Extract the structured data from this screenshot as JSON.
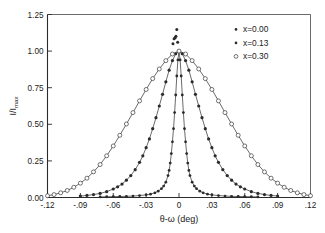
{
  "figure": {
    "background_color": "#ffffff",
    "ink_color": "#2b2b2b"
  },
  "chart_data": {
    "type": "line",
    "title": "",
    "subtitle": "",
    "xlabel": "θ-ω  (deg)",
    "ylabel": "I/I max",
    "ylabel_main": "I/I",
    "ylabel_sub": "max",
    "xlim": [
      -0.12,
      0.12
    ],
    "ylim": [
      0.0,
      1.25
    ],
    "grid": false,
    "legend_position": "top-right",
    "xticks": [
      -0.12,
      -0.09,
      -0.06,
      -0.03,
      0,
      0.03,
      0.06,
      0.09,
      0.12
    ],
    "xtick_labels": [
      "-.12",
      "-.09",
      "-.06",
      "-.03",
      "0",
      ".03",
      ".06",
      ".09",
      ".12"
    ],
    "yticks": [
      0.0,
      0.25,
      0.5,
      0.75,
      1.0,
      1.25
    ],
    "ytick_labels": [
      "0.00",
      "0.25",
      "0.50",
      "0.75",
      "1.00",
      "1.25"
    ],
    "series": [
      {
        "name": "x=0.00",
        "marker": "filled-dot",
        "marker_size": 1.4,
        "fwhm_deg": 0.0105,
        "peak": 1.0,
        "x": [
          -0.072,
          -0.066,
          -0.06,
          -0.054,
          -0.048,
          -0.042,
          -0.036,
          -0.03,
          -0.026,
          -0.022,
          -0.019,
          -0.016,
          -0.014,
          -0.012,
          -0.01,
          -0.009,
          -0.008,
          -0.007,
          -0.006,
          -0.005,
          -0.004,
          -0.003,
          -0.002,
          -0.001,
          0.0,
          0.001,
          0.002,
          0.003,
          0.004,
          0.005,
          0.006,
          0.007,
          0.008,
          0.009,
          0.01,
          0.012,
          0.014,
          0.016,
          0.019,
          0.022,
          0.026,
          0.03,
          0.036,
          0.042,
          0.048,
          0.054,
          0.06,
          0.066,
          0.072
        ],
        "y": [
          0.004,
          0.005,
          0.006,
          0.007,
          0.008,
          0.01,
          0.013,
          0.018,
          0.023,
          0.032,
          0.043,
          0.06,
          0.078,
          0.105,
          0.15,
          0.185,
          0.235,
          0.3,
          0.38,
          0.47,
          0.58,
          0.7,
          0.83,
          0.94,
          1.0,
          0.94,
          0.83,
          0.7,
          0.58,
          0.47,
          0.38,
          0.3,
          0.235,
          0.185,
          0.15,
          0.105,
          0.078,
          0.06,
          0.043,
          0.032,
          0.023,
          0.018,
          0.013,
          0.01,
          0.008,
          0.007,
          0.006,
          0.005,
          0.004
        ]
      },
      {
        "name": "x=0.13",
        "marker": "filled-dot",
        "marker_size": 1.6,
        "fwhm_deg": 0.044,
        "peak": 1.0,
        "x": [
          -0.09,
          -0.084,
          -0.078,
          -0.072,
          -0.066,
          -0.06,
          -0.056,
          -0.052,
          -0.048,
          -0.044,
          -0.04,
          -0.036,
          -0.033,
          -0.03,
          -0.027,
          -0.024,
          -0.021,
          -0.018,
          -0.015,
          -0.012,
          -0.009,
          -0.006,
          -0.003,
          0.0,
          0.003,
          0.006,
          0.009,
          0.012,
          0.015,
          0.018,
          0.021,
          0.024,
          0.027,
          0.03,
          0.033,
          0.036,
          0.04,
          0.044,
          0.048,
          0.052,
          0.056,
          0.06,
          0.066,
          0.072,
          0.078,
          0.084,
          0.09
        ],
        "y": [
          0.01,
          0.014,
          0.02,
          0.028,
          0.04,
          0.058,
          0.073,
          0.092,
          0.118,
          0.15,
          0.19,
          0.24,
          0.285,
          0.34,
          0.4,
          0.47,
          0.545,
          0.625,
          0.705,
          0.79,
          0.87,
          0.935,
          0.982,
          1.0,
          0.982,
          0.935,
          0.87,
          0.79,
          0.705,
          0.625,
          0.545,
          0.47,
          0.4,
          0.34,
          0.285,
          0.24,
          0.19,
          0.15,
          0.118,
          0.092,
          0.073,
          0.058,
          0.04,
          0.028,
          0.02,
          0.014,
          0.01
        ]
      },
      {
        "name": "x=0.30",
        "marker": "open-circle",
        "marker_size": 2.0,
        "fwhm_deg": 0.088,
        "peak": 1.0,
        "x": [
          -0.12,
          -0.114,
          -0.108,
          -0.102,
          -0.096,
          -0.09,
          -0.084,
          -0.078,
          -0.072,
          -0.066,
          -0.06,
          -0.054,
          -0.048,
          -0.042,
          -0.036,
          -0.03,
          -0.024,
          -0.018,
          -0.012,
          -0.006,
          0.0,
          0.006,
          0.012,
          0.018,
          0.024,
          0.03,
          0.036,
          0.042,
          0.048,
          0.054,
          0.06,
          0.066,
          0.072,
          0.078,
          0.084,
          0.09,
          0.096,
          0.102,
          0.108,
          0.114,
          0.12
        ],
        "y": [
          0.012,
          0.02,
          0.032,
          0.048,
          0.07,
          0.098,
          0.132,
          0.175,
          0.225,
          0.285,
          0.352,
          0.425,
          0.502,
          0.58,
          0.66,
          0.738,
          0.812,
          0.878,
          0.935,
          0.98,
          1.0,
          0.98,
          0.935,
          0.878,
          0.812,
          0.738,
          0.66,
          0.58,
          0.502,
          0.425,
          0.352,
          0.285,
          0.225,
          0.175,
          0.132,
          0.098,
          0.07,
          0.048,
          0.032,
          0.02,
          0.012
        ]
      },
      {
        "name": "outlier-points",
        "marker": "filled-dot",
        "marker_size": 1.5,
        "x": [
          -0.0055,
          -0.0045,
          -0.0035,
          -0.0028,
          -0.002,
          -0.0012
        ],
        "y": [
          1.05,
          1.085,
          1.092,
          1.102,
          1.148,
          1.06
        ]
      }
    ],
    "legend": [
      {
        "label": "x=0.00",
        "marker": "filled-dot"
      },
      {
        "label": "x=0.13",
        "marker": "filled-dot"
      },
      {
        "label": "x=0.30",
        "marker": "open-circle"
      }
    ]
  }
}
